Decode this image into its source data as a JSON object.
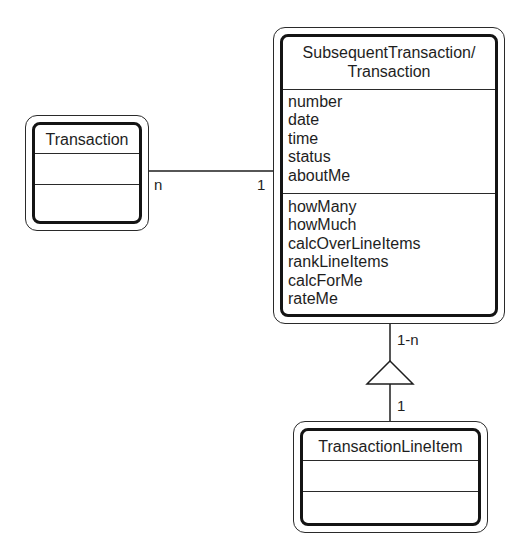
{
  "diagram": {
    "type": "UML class diagram",
    "classes": [
      {
        "id": "transaction",
        "name": "Transaction",
        "attributes": [],
        "operations": []
      },
      {
        "id": "subsequent-transaction",
        "name_line1": "SubsequentTransaction/",
        "name_line2": "Transaction",
        "attributes": [
          "number",
          "date",
          "time",
          "status",
          "aboutMe"
        ],
        "operations": [
          "howMany",
          "howMuch",
          "calcOverLineItems",
          "rankLineItems",
          "calcForMe",
          "rateMe"
        ]
      },
      {
        "id": "transaction-line-item",
        "name": "TransactionLineItem",
        "attributes": [],
        "operations": []
      }
    ],
    "associations": [
      {
        "from": "Transaction",
        "to": "SubsequentTransaction/Transaction",
        "from_multiplicity": "n",
        "to_multiplicity": "1",
        "kind": "association"
      },
      {
        "from": "SubsequentTransaction/Transaction",
        "to": "TransactionLineItem",
        "whole_multiplicity": "1-n",
        "part_multiplicity": "1",
        "kind": "whole-part (triangle)"
      }
    ],
    "colors": {
      "line": "#1e1e1e",
      "background": "#ffffff",
      "text": "#1e1e1e"
    }
  }
}
